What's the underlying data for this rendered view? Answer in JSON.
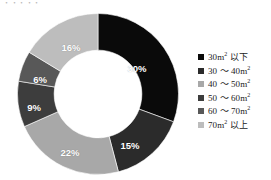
{
  "title_sliver": "・・・・・",
  "chart_data": {
    "type": "pie",
    "variant": "donut",
    "title": "",
    "xlabel": "",
    "ylabel": "",
    "start_angle": 0,
    "direction": "clockwise",
    "inner_radius_ratio": 0.545,
    "legend_position": "right",
    "grid": false,
    "categories": [
      "30m2 以下",
      "30 ～ 40m2",
      "40 ～ 50m2",
      "50 ～ 60m2",
      "60 ～ 70m2",
      "70m2 以上"
    ],
    "values": [
      30,
      15,
      22,
      9,
      6,
      16
    ],
    "data_labels": [
      "30%",
      "15%",
      "22%",
      "9%",
      "6%",
      "16%"
    ],
    "colors": [
      "#0a0a0a",
      "#2b2b2b",
      "#a8a8a8",
      "#3d3d3d",
      "#585858",
      "#bdbdbd"
    ],
    "unit": "%",
    "total": 98
  },
  "legend": {
    "items": [
      {
        "label_pre": "30m",
        "sup": "2",
        "label_post": " 以下",
        "color": "#0a0a0a",
        "swatch_name": "legend-swatch-30-under"
      },
      {
        "label_pre": "30 ～ 40m",
        "sup": "2",
        "label_post": "",
        "color": "#2b2b2b",
        "swatch_name": "legend-swatch-30-40"
      },
      {
        "label_pre": "40 ～ 50m",
        "sup": "2",
        "label_post": "",
        "color": "#a8a8a8",
        "swatch_name": "legend-swatch-40-50"
      },
      {
        "label_pre": "50 ～ 60m",
        "sup": "2",
        "label_post": "",
        "color": "#3d3d3d",
        "swatch_name": "legend-swatch-50-60"
      },
      {
        "label_pre": "60 ～ 70m",
        "sup": "2",
        "label_post": "",
        "color": "#585858",
        "swatch_name": "legend-swatch-60-70"
      },
      {
        "label_pre": "70m",
        "sup": "2",
        "label_post": " 以上",
        "color": "#bdbdbd",
        "swatch_name": "legend-swatch-70-over"
      }
    ]
  },
  "slice_labels": [
    {
      "text": "30%",
      "x": 129,
      "y": 58
    },
    {
      "text": "15%",
      "x": 122,
      "y": 135
    },
    {
      "text": "22%",
      "x": 62,
      "y": 142
    },
    {
      "text": "9%",
      "x": 26,
      "y": 97
    },
    {
      "text": "6%",
      "x": 32,
      "y": 69
    },
    {
      "text": "16%",
      "x": 63,
      "y": 37
    }
  ]
}
